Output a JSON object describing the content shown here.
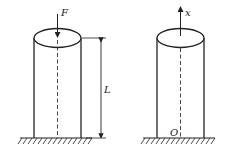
{
  "figure": {
    "left": {
      "force_label": "F",
      "length_label": "L"
    },
    "right": {
      "axis_label": "x",
      "origin_label": "O"
    }
  },
  "colors": {
    "stroke": "#222222",
    "background": "#ffffff"
  }
}
